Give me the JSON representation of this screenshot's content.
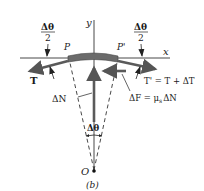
{
  "figure": {
    "caption": "(b)",
    "axes": {
      "x_label": "x",
      "y_label": "y"
    },
    "points": {
      "left": "P",
      "right": "P'",
      "origin": "O"
    },
    "angles": {
      "half_left": {
        "num": "Δθ",
        "den": "2"
      },
      "half_right": {
        "num": "Δθ",
        "den": "2"
      },
      "full": "Δθ"
    },
    "forces": {
      "tension_left": "T",
      "tension_right": "T' = T + ΔT",
      "normal": "ΔN",
      "friction": "ΔF = μ",
      "friction_sub": "s",
      "friction_tail": "ΔN"
    },
    "colors": {
      "segment": "#6b6b6b",
      "arrow": "#5a5a5a",
      "line": "#333333"
    }
  }
}
